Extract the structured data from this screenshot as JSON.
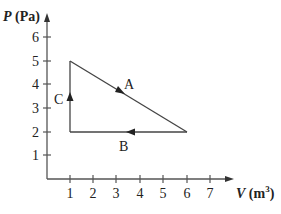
{
  "figure": {
    "type": "PV diagram",
    "y_axis_label": {
      "var": "P",
      "unit": " (Pa)"
    },
    "x_axis_label": {
      "var": "V",
      "unit": " (m",
      "sup": "3",
      "close": ")"
    },
    "x_ticks": [
      "1",
      "2",
      "3",
      "4",
      "5",
      "6",
      "7"
    ],
    "y_ticks": [
      "1",
      "2",
      "3",
      "4",
      "5",
      "6"
    ],
    "paths": [
      {
        "label": "A",
        "from": [
          1,
          5
        ],
        "to": [
          6,
          2
        ],
        "direction": "down-right"
      },
      {
        "label": "B",
        "from": [
          6,
          2
        ],
        "to": [
          1,
          2
        ],
        "direction": "left"
      },
      {
        "label": "C",
        "from": [
          1,
          2
        ],
        "to": [
          1,
          5
        ],
        "direction": "up"
      }
    ],
    "colors": {
      "line": "#444444",
      "text": "#222222",
      "background": "#ffffff"
    }
  }
}
